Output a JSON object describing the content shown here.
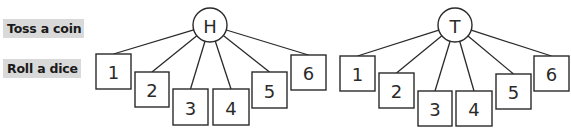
{
  "labels": {
    "coin": "Toss a coin",
    "dice": "Roll a dice"
  },
  "colors": {
    "label_bg": "#d9d9d9",
    "stroke": "#2a2a2a",
    "text": "#1a1a1a"
  },
  "trees": [
    {
      "root": {
        "label": "H",
        "cx": 210,
        "cy": 25,
        "r": 17
      },
      "children": [
        {
          "label": "1",
          "x": 96,
          "y": 54,
          "w": 35,
          "h": 35
        },
        {
          "label": "2",
          "x": 135,
          "y": 72,
          "w": 34,
          "h": 35
        },
        {
          "label": "3",
          "x": 173,
          "y": 89,
          "w": 35,
          "h": 36
        },
        {
          "label": "4",
          "x": 213,
          "y": 89,
          "w": 36,
          "h": 36
        },
        {
          "label": "5",
          "x": 252,
          "y": 72,
          "w": 35,
          "h": 36
        },
        {
          "label": "6",
          "x": 291,
          "y": 55,
          "w": 35,
          "h": 35
        }
      ]
    },
    {
      "root": {
        "label": "T",
        "cx": 455,
        "cy": 25,
        "r": 17
      },
      "children": [
        {
          "label": "1",
          "x": 340,
          "y": 56,
          "w": 35,
          "h": 35
        },
        {
          "label": "2",
          "x": 379,
          "y": 73,
          "w": 35,
          "h": 35
        },
        {
          "label": "3",
          "x": 418,
          "y": 91,
          "w": 34,
          "h": 35
        },
        {
          "label": "4",
          "x": 456,
          "y": 91,
          "w": 36,
          "h": 35
        },
        {
          "label": "5",
          "x": 496,
          "y": 74,
          "w": 35,
          "h": 35
        },
        {
          "label": "6",
          "x": 534,
          "y": 56,
          "w": 35,
          "h": 35
        }
      ]
    }
  ]
}
